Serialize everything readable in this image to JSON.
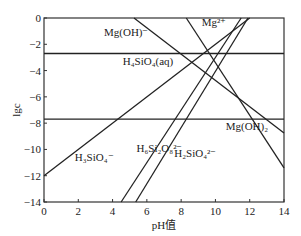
{
  "chart_data": {
    "type": "line",
    "title": "",
    "xlabel": "pH值",
    "ylabel": "lgc",
    "xlim": [
      0,
      14
    ],
    "ylim": [
      -14,
      0
    ],
    "xticks": [
      "0",
      "2",
      "4",
      "6",
      "8",
      "10",
      "12",
      "14"
    ],
    "yticks": [
      "0",
      "-2",
      "-4",
      "-6",
      "-8",
      "-10",
      "-12",
      "-14"
    ],
    "grid": false,
    "series": [
      {
        "name": "Mg(OH)⁺",
        "points": [
          [
            5.25,
            0
          ],
          [
            14,
            -8.75
          ]
        ]
      },
      {
        "name": "Mg²⁺",
        "points": [
          [
            8.3,
            0
          ],
          [
            14,
            -11.4
          ]
        ]
      },
      {
        "name": "H₄SiO₄(aq)",
        "points": [
          [
            0,
            -2.7
          ],
          [
            14,
            -2.7
          ]
        ]
      },
      {
        "name": "Mg(OH)₂",
        "points": [
          [
            0,
            -7.7
          ],
          [
            14,
            -7.7
          ]
        ]
      },
      {
        "name": "H₃SiO₄⁻",
        "points": [
          [
            0,
            -12
          ],
          [
            12,
            0
          ]
        ]
      },
      {
        "name": "H₆Si₂O₈²⁻",
        "points": [
          [
            4.5,
            -14
          ],
          [
            11.5,
            0
          ]
        ]
      },
      {
        "name": "H₂SiO₄²⁻",
        "points": [
          [
            5.35,
            -14
          ],
          [
            11.9,
            0
          ]
        ]
      }
    ],
    "annotations": [
      {
        "text": "Mg(OH)⁻",
        "x": 3.5,
        "y": -1.4
      },
      {
        "text": "Mg²⁺",
        "x": 9.2,
        "y": -0.6
      },
      {
        "text": "H₄SiO₄(aq)",
        "x": 4.6,
        "y": -3.6
      },
      {
        "text": "Mg(OH)₂",
        "x": 10.6,
        "y": -8.5
      },
      {
        "text": "H₃SiO₄⁻",
        "x": 1.8,
        "y": -10.9
      },
      {
        "text": "H₆Si₂O₈²⁻",
        "x": 5.4,
        "y": -10.2
      },
      {
        "text": "H₂SiO₄²⁻",
        "x": 7.6,
        "y": -10.6
      }
    ]
  }
}
